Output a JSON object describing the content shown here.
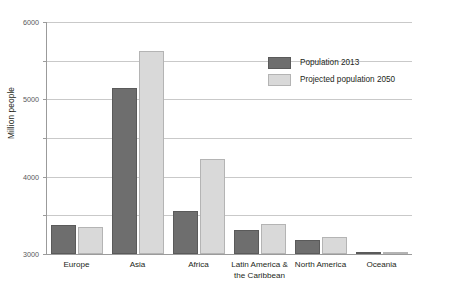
{
  "chart_data": {
    "type": "bar",
    "title": "",
    "xlabel": "",
    "ylabel": "Million people",
    "ylim": [
      0,
      6000
    ],
    "yticks": [
      0,
      1000,
      2000,
      3000,
      4000,
      5000,
      6000
    ],
    "ytick_labels": [
      "0",
      "1000",
      "2000",
      "3000",
      "4000",
      "5000",
      "6000"
    ],
    "grid": true,
    "legend_position": "upper right inside",
    "categories": [
      "Europe",
      "Asia",
      "Africa",
      "Latin America &\nthe Caribbean",
      "North America",
      "Oceania"
    ],
    "series": [
      {
        "name": "Population 2013",
        "color": "#6e6e6e",
        "values": [
          740,
          4300,
          1110,
          620,
          350,
          40
        ]
      },
      {
        "name": "Projected population 2050",
        "color": "#d9d9d9",
        "values": [
          700,
          5250,
          2470,
          780,
          440,
          60
        ]
      }
    ]
  },
  "axis": {
    "y_title": "Million people"
  },
  "legend": {
    "items": [
      {
        "label": "Population 2013"
      },
      {
        "label": "Projected population 2050"
      }
    ]
  },
  "categories_display": [
    {
      "line1": "Europe",
      "line2": ""
    },
    {
      "line1": "Asia",
      "line2": ""
    },
    {
      "line1": "Africa",
      "line2": ""
    },
    {
      "line1": "Latin America &",
      "line2": "the Caribbean"
    },
    {
      "line1": "North America",
      "line2": ""
    },
    {
      "line1": "Oceania",
      "line2": ""
    }
  ],
  "colors": {
    "series_2013": "#6e6e6e",
    "series_2050": "#d9d9d9",
    "gridline": "#c9c9c9",
    "axis": "#9b9b9b",
    "text": "#231f20"
  }
}
